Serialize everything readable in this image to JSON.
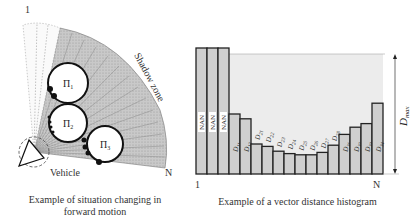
{
  "left_diagram": {
    "start_label": "1",
    "end_label": "N",
    "shadow_zone_label": "Shadow zone",
    "vehicle_label": "Vehicle",
    "obstacles": [
      {
        "label": "Π",
        "sub": "1"
      },
      {
        "label": "Π",
        "sub": "2"
      },
      {
        "label": "Π",
        "sub": "3"
      }
    ],
    "caption_line1": "Example of situation changing in",
    "caption_line2": "forward motion"
  },
  "right_diagram": {
    "start_label": "1",
    "end_label": "N",
    "dmax_label": "D",
    "dmax_sub": "max",
    "caption": "Example of a vector distance histogram"
  },
  "chart_data": {
    "type": "bar",
    "title": "Example of a vector distance histogram",
    "xlabel": "",
    "ylabel": "",
    "x_range_labels": [
      "1",
      "N"
    ],
    "ylim_label": "Dmax",
    "categories": [
      "NAN",
      "NAN",
      "NAN",
      "D11",
      "D12",
      "D21",
      "D22",
      "D23",
      "D24",
      "D25",
      "D26",
      "D27",
      "D28",
      "D31",
      "D32",
      "D33",
      "D34"
    ],
    "values": [
      1.05,
      1.05,
      1.05,
      0.5,
      0.46,
      0.25,
      0.23,
      0.19,
      0.17,
      0.16,
      0.16,
      0.18,
      0.24,
      0.33,
      0.39,
      0.42,
      0.59
    ],
    "value_note": "relative to Dmax = 1.0; NAN bars exceed Dmax",
    "grid": false
  }
}
